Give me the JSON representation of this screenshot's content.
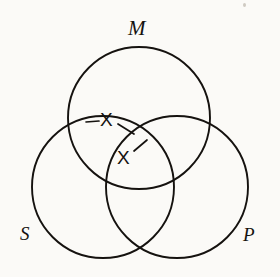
{
  "figure": {
    "background_color": "#fbfaf7",
    "stroke_color": "#15120f",
    "circles": [
      {
        "id": "M",
        "label": "M",
        "cx": 139,
        "cy": 118,
        "r": 71,
        "label_x": 128,
        "label_y": 18
      },
      {
        "id": "S",
        "label": "S",
        "cx": 103,
        "cy": 187,
        "r": 71,
        "label_x": 20,
        "label_y": 224
      },
      {
        "id": "P",
        "label": "P",
        "cx": 177,
        "cy": 187,
        "r": 71,
        "label_x": 243,
        "label_y": 225
      }
    ],
    "marks": [
      {
        "id": "x-upper",
        "label": "X",
        "x": 100,
        "y": 110,
        "region": "M-only-left-edge"
      },
      {
        "id": "x-lower",
        "label": "X",
        "x": 117,
        "y": 148,
        "region": "S-and-M"
      }
    ],
    "connectors": [
      {
        "id": "bar-left-of-upper-x",
        "x1": 86,
        "y1": 122,
        "x2": 99,
        "y2": 121
      },
      {
        "id": "bar-right-of-upper-x",
        "x1": 117,
        "y1": 124,
        "x2": 133,
        "y2": 133
      },
      {
        "id": "bar-right-of-lower-x",
        "x1": 133,
        "y1": 150,
        "x2": 145,
        "y2": 141
      }
    ]
  }
}
